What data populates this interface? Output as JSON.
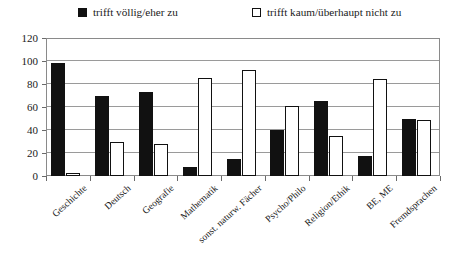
{
  "chart_data": {
    "type": "bar",
    "title": "",
    "subtitle": "",
    "xlabel": "",
    "ylabel": "",
    "ylim": [
      0,
      120
    ],
    "yticks": [
      0,
      20,
      40,
      60,
      80,
      100,
      120
    ],
    "grid": true,
    "legend_position": "top",
    "categories": [
      "Geschichte",
      "Deutsch",
      "Geografie",
      "Mathematik",
      "sonst. naturw. Fächer",
      "Psycho/Philo",
      "Religion/Ethik",
      "BE, ME",
      "Fremdsprachen"
    ],
    "series": [
      {
        "name": "trifft völlig/eher zu",
        "color": "#111111",
        "style": "filled",
        "values": [
          98,
          70,
          73,
          8,
          15,
          40,
          65,
          17,
          50
        ]
      },
      {
        "name": "trifft kaum/überhaupt nicht zu",
        "color": "#ffffff",
        "style": "hollow",
        "values": [
          3,
          30,
          28,
          85,
          92,
          61,
          35,
          84,
          49
        ]
      }
    ]
  },
  "legend": {
    "entries": [
      {
        "label": "trifft völlig/eher zu",
        "swatch": "filled-square-icon"
      },
      {
        "label": "trifft kaum/überhaupt nicht zu",
        "swatch": "hollow-square-icon"
      }
    ]
  },
  "colors": {
    "series_filled": "#111111",
    "series_hollow": "#ffffff",
    "axis": "#8a8a8a",
    "gridline": "#9a9a9a",
    "text": "#1a1a1a",
    "background": "#ffffff"
  }
}
